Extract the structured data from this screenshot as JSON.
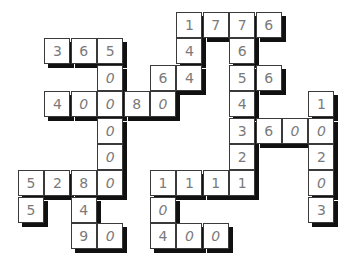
{
  "puzzle": {
    "type": "number-crossword",
    "grid_origin": {
      "x": 18,
      "y": 12
    },
    "cell_pitch": 26.4,
    "cells": [
      {
        "c": 6,
        "r": 0,
        "v": "1"
      },
      {
        "c": 7,
        "r": 0,
        "v": "7"
      },
      {
        "c": 8,
        "r": 0,
        "v": "7"
      },
      {
        "c": 9,
        "r": 0,
        "v": "6"
      },
      {
        "c": 1,
        "r": 1,
        "v": "3"
      },
      {
        "c": 2,
        "r": 1,
        "v": "6"
      },
      {
        "c": 3,
        "r": 1,
        "v": "5"
      },
      {
        "c": 6,
        "r": 1,
        "v": "4"
      },
      {
        "c": 8,
        "r": 1,
        "v": "6"
      },
      {
        "c": 3,
        "r": 2,
        "v": "0"
      },
      {
        "c": 5,
        "r": 2,
        "v": "6"
      },
      {
        "c": 6,
        "r": 2,
        "v": "4"
      },
      {
        "c": 8,
        "r": 2,
        "v": "5"
      },
      {
        "c": 9,
        "r": 2,
        "v": "6"
      },
      {
        "c": 1,
        "r": 3,
        "v": "4"
      },
      {
        "c": 2,
        "r": 3,
        "v": "0"
      },
      {
        "c": 3,
        "r": 3,
        "v": "0"
      },
      {
        "c": 4,
        "r": 3,
        "v": "8"
      },
      {
        "c": 5,
        "r": 3,
        "v": "0"
      },
      {
        "c": 8,
        "r": 3,
        "v": "4"
      },
      {
        "c": 11,
        "r": 3,
        "v": "1"
      },
      {
        "c": 3,
        "r": 4,
        "v": "0"
      },
      {
        "c": 8,
        "r": 4,
        "v": "3"
      },
      {
        "c": 9,
        "r": 4,
        "v": "6"
      },
      {
        "c": 10,
        "r": 4,
        "v": "0"
      },
      {
        "c": 11,
        "r": 4,
        "v": "0"
      },
      {
        "c": 3,
        "r": 5,
        "v": "0"
      },
      {
        "c": 8,
        "r": 5,
        "v": "2"
      },
      {
        "c": 11,
        "r": 5,
        "v": "2"
      },
      {
        "c": 0,
        "r": 6,
        "v": "5"
      },
      {
        "c": 1,
        "r": 6,
        "v": "2"
      },
      {
        "c": 2,
        "r": 6,
        "v": "8"
      },
      {
        "c": 3,
        "r": 6,
        "v": "0"
      },
      {
        "c": 5,
        "r": 6,
        "v": "1"
      },
      {
        "c": 6,
        "r": 6,
        "v": "1"
      },
      {
        "c": 7,
        "r": 6,
        "v": "1"
      },
      {
        "c": 8,
        "r": 6,
        "v": "1"
      },
      {
        "c": 11,
        "r": 6,
        "v": "0"
      },
      {
        "c": 0,
        "r": 7,
        "v": "5"
      },
      {
        "c": 2,
        "r": 7,
        "v": "4"
      },
      {
        "c": 5,
        "r": 7,
        "v": "0"
      },
      {
        "c": 11,
        "r": 7,
        "v": "3"
      },
      {
        "c": 2,
        "r": 8,
        "v": "9"
      },
      {
        "c": 3,
        "r": 8,
        "v": "0"
      },
      {
        "c": 5,
        "r": 8,
        "v": "4"
      },
      {
        "c": 6,
        "r": 8,
        "v": "0"
      },
      {
        "c": 7,
        "r": 8,
        "v": "0"
      }
    ],
    "entries_across": [
      "1776",
      "365",
      "56",
      "40080",
      "3600",
      "5280",
      "1111",
      "90",
      "400",
      "64"
    ],
    "entries_down": [
      "50000",
      "144",
      "76543",
      "1111",
      "1020",
      "104",
      "5",
      "489"
    ],
    "colors": {
      "border": "#3a3a3a",
      "digit": "#7a7a7a",
      "shadow": "#111111",
      "background": "#ffffff"
    }
  }
}
